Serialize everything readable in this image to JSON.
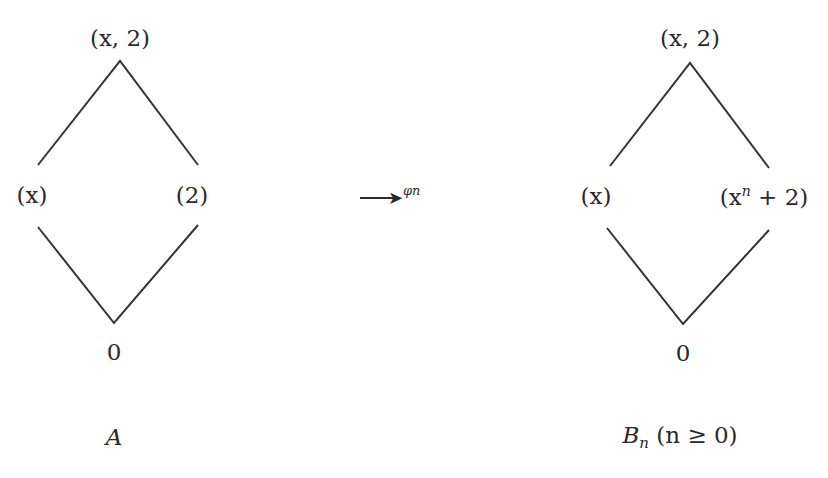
{
  "diagrams": [
    {
      "name": "A",
      "caption": "A",
      "nodes": {
        "top": "(x, 2)",
        "left": "(x)",
        "right": "(2)",
        "bottom": "0"
      }
    },
    {
      "name": "B_n",
      "caption_main": "B",
      "caption_sub": "n",
      "caption_cond": "(n ≥ 0)",
      "nodes": {
        "top": "(x, 2)",
        "left": "(x)",
        "right_prefix": "(x",
        "right_sup": "n",
        "right_suffix": " + 2)",
        "bottom": "0"
      }
    }
  ],
  "arrow": {
    "glyph": "→",
    "label": "φn"
  }
}
